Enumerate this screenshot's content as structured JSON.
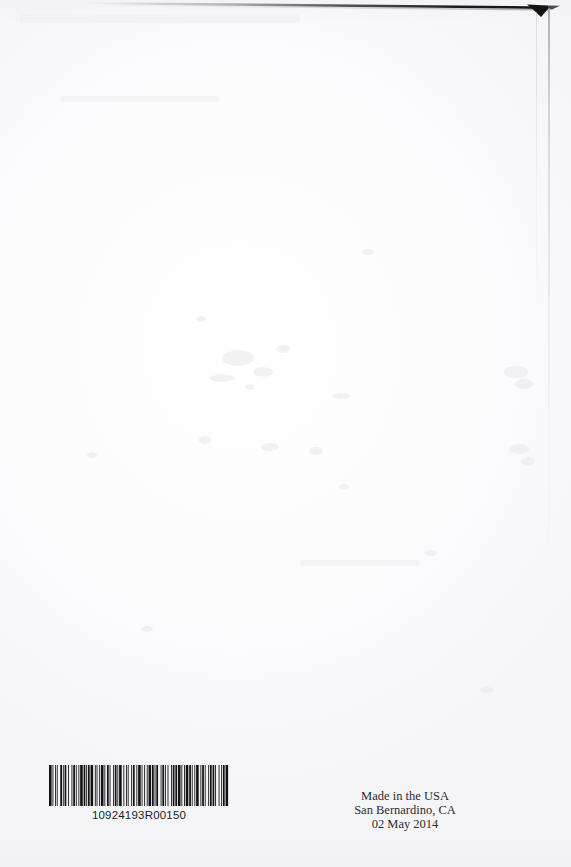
{
  "document": {
    "kind": "scanned-book-back-cover",
    "page_width": 571,
    "page_height": 867,
    "background_color": "#ffffff"
  },
  "barcode": {
    "icon": "barcode-icon",
    "symbology_label": "barcode",
    "number": "10924193R00150",
    "bar_color": "#121212",
    "modules": [
      3,
      1,
      1,
      2,
      1,
      1,
      1,
      3,
      2,
      1,
      1,
      1,
      2,
      2,
      1,
      3,
      1,
      1,
      2,
      1,
      1,
      2,
      1,
      1,
      3,
      1,
      2,
      1,
      1,
      1,
      2,
      1,
      3,
      2,
      1,
      1,
      1,
      2,
      1,
      1,
      3,
      1,
      1,
      2,
      2,
      1,
      1,
      3,
      1,
      1,
      2,
      1,
      1,
      1,
      3,
      2,
      1,
      2,
      1,
      1,
      1,
      3,
      1,
      1,
      2,
      2,
      1,
      1,
      3,
      1,
      1,
      2,
      1,
      2,
      1,
      1,
      3,
      1,
      2,
      1,
      1,
      1,
      2,
      3,
      1,
      1,
      2,
      1,
      1,
      2,
      1,
      3,
      1,
      1,
      2,
      1,
      2,
      1,
      3,
      1,
      1,
      2,
      1,
      1,
      3,
      1,
      2,
      1,
      1,
      2,
      1,
      1,
      3,
      2,
      1,
      1,
      2,
      1,
      1,
      3,
      1,
      1,
      2,
      1,
      2,
      1,
      1,
      3,
      1,
      2,
      1,
      1,
      2,
      1,
      3,
      1
    ]
  },
  "imprint": {
    "line1": "Made in the USA",
    "line2": "San Bernardino, CA",
    "line3": "02 May 2014"
  },
  "artifacts": {
    "top_edge_line_color": "#1a1a1a",
    "corner_wedge_color": "#141414",
    "right_edge_line_color": "#9a9a9f"
  }
}
